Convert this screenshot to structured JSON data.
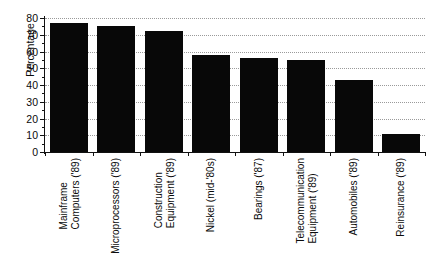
{
  "chart_data": {
    "type": "bar",
    "title": "",
    "xlabel": "",
    "ylabel": "Percentage",
    "ylim": [
      0,
      80
    ],
    "ytick_step": 10,
    "minor_ticks": true,
    "grid": "horizontal-dotted",
    "legend": "none",
    "bar_color": "#080808",
    "categories": [
      "Mainframe Computers ('89)",
      "Microprocessors ('89)",
      "Construction Equipment ('89)",
      "Nickel (mid-'80s)",
      "Bearings ('87)",
      "Telecommunication Equipment ('89)",
      "Automobiles ('89)",
      "Reinsurance ('89)"
    ],
    "category_lines": [
      [
        "Mainframe",
        "Computers ('89)"
      ],
      [
        "Microprocessors ('89)"
      ],
      [
        "Construction",
        "Equipment ('89)"
      ],
      [
        "Nickel (mid-'80s)"
      ],
      [
        "Bearings ('87)"
      ],
      [
        "Telecommunication",
        "Equipment ('89)"
      ],
      [
        "Automobiles ('89)"
      ],
      [
        "Reinsurance ('89)"
      ]
    ],
    "values": [
      77,
      75,
      72,
      58,
      56,
      55,
      43,
      11
    ],
    "ytick_labels": [
      "0",
      "10",
      "20",
      "30",
      "40",
      "50",
      "60",
      "70",
      "80"
    ],
    "ytick_values": [
      0,
      10,
      20,
      30,
      40,
      50,
      60,
      70,
      80
    ]
  }
}
